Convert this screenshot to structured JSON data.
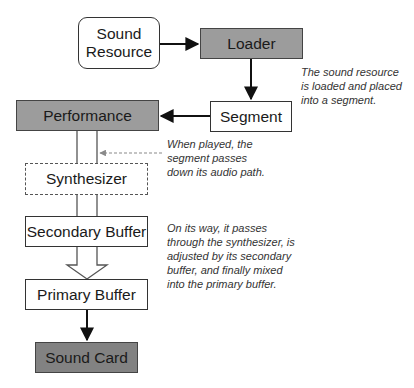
{
  "diagram": {
    "nodes": {
      "sound_resource": "Sound\nResource",
      "sound_resource_line1": "Sound",
      "sound_resource_line2": "Resource",
      "loader": "Loader",
      "segment": "Segment",
      "performance": "Performance",
      "synthesizer": "Synthesizer",
      "secondary_buffer": "Secondary Buffer",
      "primary_buffer": "Primary Buffer",
      "sound_card": "Sound Card"
    },
    "notes": {
      "load": [
        "The sound resource",
        "is loaded and placed",
        "into a segment."
      ],
      "play": [
        "When played, the",
        "segment passes",
        "down its audio path."
      ],
      "path": [
        "On its way, it passes",
        "through the synthesizer, is",
        "adjusted by its secondary",
        "buffer, and finally mixed",
        "into the primary buffer."
      ]
    },
    "edges": [
      {
        "from": "Sound Resource",
        "to": "Loader",
        "style": "solid-arrow"
      },
      {
        "from": "Loader",
        "to": "Segment",
        "style": "solid-arrow"
      },
      {
        "from": "Segment",
        "to": "Performance",
        "style": "solid-arrow"
      },
      {
        "from": "Performance",
        "to": "Synthesizer",
        "style": "double-line"
      },
      {
        "from": "note-play",
        "to": "Performance-Synthesizer path",
        "style": "dashed-gray-arrow"
      },
      {
        "from": "Synthesizer",
        "to": "Secondary Buffer",
        "style": "double-line"
      },
      {
        "from": "Secondary Buffer",
        "to": "Primary Buffer",
        "style": "hollow-arrow"
      },
      {
        "from": "Primary Buffer",
        "to": "Sound Card",
        "style": "solid-arrow"
      }
    ],
    "colors": {
      "gray_fill": "#9c9c9c",
      "dark_fill": "#828282",
      "line": "#1a1a1a",
      "dashed_arrow": "#8a8a8a"
    }
  }
}
